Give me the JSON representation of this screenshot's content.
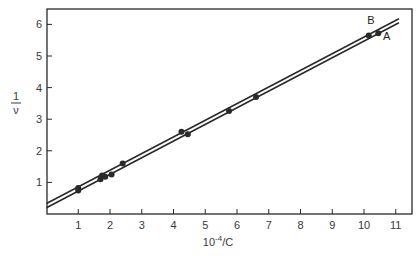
{
  "chart_data": {
    "type": "scatter",
    "title": "",
    "xlabel": "10^-4/C",
    "xlabel_display": {
      "base": "10",
      "exp": "-4",
      "suffix": "/C"
    },
    "ylabel": "1/ν",
    "ylabel_display": {
      "num": "1",
      "den": "ν"
    },
    "xlim": [
      0,
      11.5
    ],
    "ylim": [
      0,
      6.5
    ],
    "x_ticks": [
      1,
      2,
      3,
      4,
      5,
      6,
      7,
      8,
      9,
      10,
      11
    ],
    "y_ticks": [
      1,
      2,
      3,
      4,
      5,
      6
    ],
    "grid": false,
    "legend": "none (lines labeled directly)",
    "series": [
      {
        "name": "B",
        "kind": "line",
        "intercept": 0.33,
        "slope": 0.527,
        "x_range": [
          0,
          11.1
        ],
        "points": [
          {
            "x": 1.0,
            "y": 0.82
          },
          {
            "x": 1.75,
            "y": 1.22
          },
          {
            "x": 2.4,
            "y": 1.6
          },
          {
            "x": 4.25,
            "y": 2.6
          },
          {
            "x": 10.15,
            "y": 5.65
          }
        ]
      },
      {
        "name": "A",
        "kind": "line",
        "intercept": 0.2,
        "slope": 0.527,
        "x_range": [
          0,
          11.1
        ],
        "points": [
          {
            "x": 1.0,
            "y": 0.74
          },
          {
            "x": 1.7,
            "y": 1.1
          },
          {
            "x": 1.85,
            "y": 1.18
          },
          {
            "x": 2.05,
            "y": 1.25
          },
          {
            "x": 4.45,
            "y": 2.52
          },
          {
            "x": 5.75,
            "y": 3.26
          },
          {
            "x": 6.6,
            "y": 3.7
          },
          {
            "x": 10.45,
            "y": 5.72
          }
        ]
      }
    ],
    "annotations": [
      {
        "text": "B",
        "x": 10.1,
        "y": 6.0
      },
      {
        "text": "A",
        "x": 10.6,
        "y": 5.5
      }
    ]
  },
  "colors": {
    "ink": "#2a2a2a",
    "background": "#ffffff"
  }
}
